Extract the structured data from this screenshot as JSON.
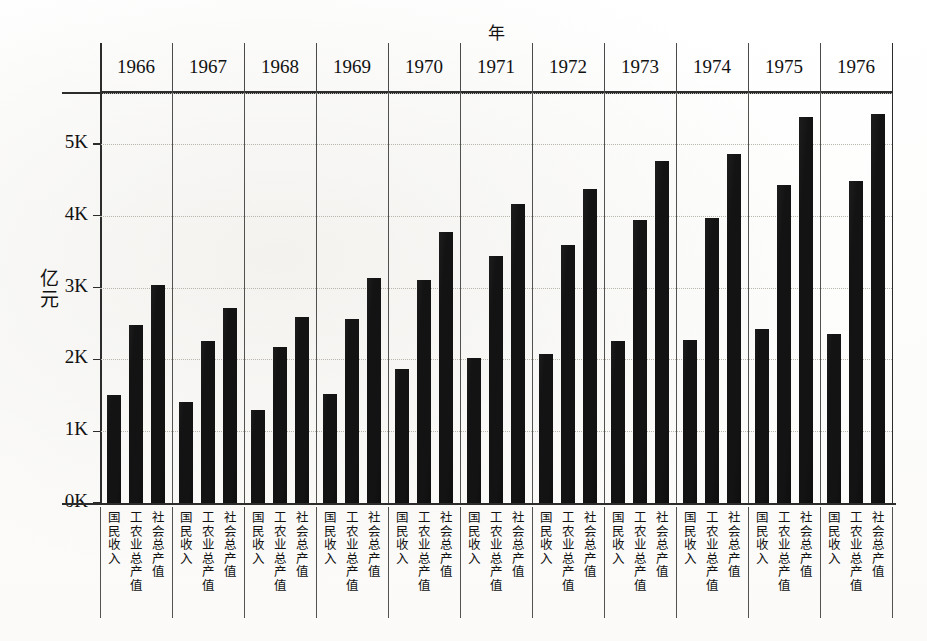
{
  "chart_data": {
    "type": "bar",
    "title": "",
    "xlabel": "年",
    "ylabel": "亿元",
    "categories": [
      "1966",
      "1967",
      "1968",
      "1969",
      "1970",
      "1971",
      "1972",
      "1973",
      "1974",
      "1975",
      "1976"
    ],
    "group_categories": [
      "国民收入",
      "工农业总产值",
      "社会总产值"
    ],
    "series": [
      {
        "name": "国民收入",
        "values": [
          1500,
          1400,
          1300,
          1520,
          1860,
          2020,
          2080,
          2250,
          2270,
          2420,
          2350
        ]
      },
      {
        "name": "工农业总产值",
        "values": [
          2480,
          2250,
          2170,
          2560,
          3100,
          3440,
          3600,
          3940,
          3970,
          4430,
          4490
        ]
      },
      {
        "name": "社会总产值",
        "values": [
          3040,
          2710,
          2590,
          3140,
          3780,
          4170,
          4380,
          4760,
          4860,
          5370,
          5420
        ]
      }
    ],
    "ylim": [
      0,
      5800
    ],
    "ytick_values": [
      0,
      1000,
      2000,
      3000,
      4000,
      5000
    ],
    "ytick_labels": [
      "0K",
      "1K",
      "2K",
      "3K",
      "4K",
      "5K"
    ],
    "grid": true,
    "legend_position": "none",
    "bar_color": "#131313",
    "axis_color": "#2c2c2c",
    "gridline_color": "#b9b6ae"
  },
  "axes": {
    "year_axis_title": "年",
    "value_axis_title_chars": [
      "亿",
      "元"
    ]
  }
}
